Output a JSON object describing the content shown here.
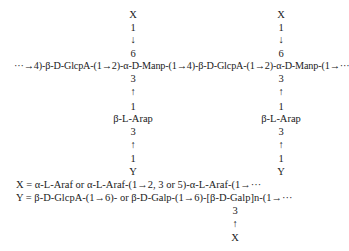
{
  "diagram": {
    "type": "polysaccharide-structure",
    "columns": [
      {
        "top_branch": [
          "X",
          "1",
          "↓",
          "6"
        ],
        "bottom_branch": [
          "3",
          "↑",
          "1",
          "β-L-Arap",
          "3",
          "↑",
          "1",
          "Y"
        ]
      },
      {
        "top_branch": [
          "X",
          "1",
          "↓",
          "6"
        ],
        "bottom_branch": [
          "3",
          "↑",
          "1",
          "β-L-Arap",
          "3",
          "↑",
          "1",
          "Y"
        ]
      }
    ],
    "backbone": "···→4)-β-D-GlcpA-(1→2)-α-D-Manp-(1→4)-β-D-GlcpA-(1→2)-α-D-Manp-(1→···",
    "definitions": {
      "x_def": "X = α-L-Araf or α-L-Araf-(1→2, 3 or 5)-α-L-Araf-(1→···",
      "y_def": "Y = β-D-GlcpA-(1→6)- or β-D-Galp-(1→6)-[β-D-Galp]n-(1→···",
      "y_branch": [
        "3",
        "↑",
        "X"
      ]
    }
  }
}
